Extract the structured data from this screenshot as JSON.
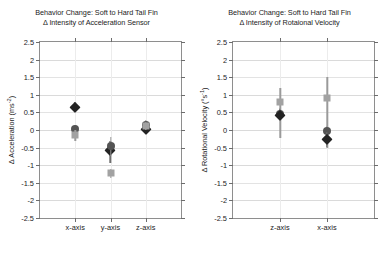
{
  "figure": {
    "background": "#ffffff",
    "marker_colors": {
      "diamond": "#232323",
      "circle": "#545454",
      "square": "#a2a2a2",
      "errorbar": "#9a9a9a"
    }
  },
  "chart_data": [
    {
      "type": "scatter",
      "id": "acceleration",
      "title": "Behavior Change: Soft to Hard Tail Fin",
      "subtitle": "Δ Intensity of Acceleration Sensor",
      "xlabel": "",
      "ylabel": "Δ Acceleration (ms⁻²)",
      "ylabel_text": "Δ Acceleration (ms",
      "ylabel_sup": "-2",
      "ylabel_close": ")",
      "ylim": [
        -2.5,
        2.5
      ],
      "ytick_labels": [
        "2.5",
        "2",
        "1.5",
        "1",
        "0.5",
        "0",
        "-0.5",
        "-1",
        "-1.5",
        "-2",
        "-2.5"
      ],
      "ytick_values": [
        2.5,
        2,
        1.5,
        1,
        0.5,
        0,
        -0.5,
        -1,
        -1.5,
        -2,
        -2.5
      ],
      "grid": true,
      "legend": "none",
      "categories": [
        "x-axis",
        "y-axis",
        "z-axis"
      ],
      "series": [
        {
          "name": "diamond",
          "marker": "diamond",
          "values": [
            0.65,
            -0.58,
            0.02
          ],
          "err_low": [
            0.5,
            -0.95,
            -0.1
          ],
          "err_high": [
            0.8,
            -0.3,
            0.15
          ]
        },
        {
          "name": "circle",
          "marker": "circle",
          "values": [
            0.02,
            -0.45,
            0.14
          ],
          "err_low": [
            -0.12,
            -0.75,
            0.0
          ],
          "err_high": [
            0.14,
            -0.2,
            0.28
          ]
        },
        {
          "name": "square",
          "marker": "square",
          "values": [
            -0.14,
            -1.22,
            0.1
          ],
          "err_low": [
            -0.3,
            -1.35,
            0.0
          ],
          "err_high": [
            0.0,
            -1.1,
            0.22
          ]
        }
      ]
    },
    {
      "type": "scatter",
      "id": "rotational-velocity",
      "title": "Behavior Change: Soft to Hard Tail Fin",
      "subtitle": "Δ Intensity of Rotaional Velocity",
      "xlabel": "",
      "ylabel": "Δ Rotational Velocity (°s⁻¹)",
      "ylabel_text": "Δ Rotational Velocity (°s",
      "ylabel_sup": "-1",
      "ylabel_close": ")",
      "ylim": [
        -2.5,
        2.5
      ],
      "ytick_labels": [
        "2.5",
        "2",
        "1.5",
        "1",
        "0.5",
        "0",
        "-0.5",
        "-1",
        "-1.5",
        "-2",
        "-2.5"
      ],
      "ytick_values": [
        2.5,
        2,
        1.5,
        1,
        0.5,
        0,
        -0.5,
        -1,
        -1.5,
        -2,
        -2.5
      ],
      "grid": true,
      "legend": "none",
      "categories": [
        "z-axis",
        "x-axis"
      ],
      "series": [
        {
          "name": "square",
          "marker": "square",
          "values": [
            0.8,
            0.92
          ],
          "err_low": [
            -0.22,
            -0.5
          ],
          "err_high": [
            1.2,
            1.5
          ]
        },
        {
          "name": "circle",
          "marker": "circle",
          "values": [
            0.46,
            -0.04
          ],
          "err_low": [
            0.3,
            -0.25
          ],
          "err_high": [
            0.62,
            0.12
          ]
        },
        {
          "name": "diamond",
          "marker": "diamond",
          "values": [
            0.44,
            -0.26
          ],
          "err_low": [
            0.28,
            -0.48
          ],
          "err_high": [
            0.6,
            -0.05
          ]
        }
      ]
    }
  ]
}
